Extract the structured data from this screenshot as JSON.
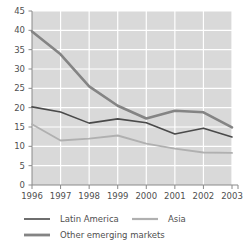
{
  "chart_data": {
    "type": "line",
    "title": "",
    "xlabel": "",
    "ylabel": "",
    "categories": [
      "1996",
      "1997",
      "1998",
      "1999",
      "2000",
      "2001",
      "2002",
      "2003"
    ],
    "x": [
      1996,
      1997,
      1998,
      1999,
      2000,
      2001,
      2002,
      2003
    ],
    "ylim": [
      0,
      45
    ],
    "xlim": [
      1996,
      2003
    ],
    "y_ticks": [
      0,
      5,
      10,
      15,
      20,
      25,
      30,
      35,
      40,
      45
    ],
    "y_tick_labels": [
      "0",
      "5",
      "10",
      "15",
      "20",
      "25",
      "30",
      "35",
      "40",
      "45"
    ],
    "grid": true,
    "grid_color": "#ffffff",
    "plot_background": "#d9d9d9",
    "legend_position": "bottom",
    "series": [
      {
        "name": "Latin America",
        "color": "#4a4a4a",
        "width": 1.6,
        "values": [
          20.2,
          18.9,
          16.0,
          17.1,
          16.1,
          13.2,
          14.7,
          12.4
        ]
      },
      {
        "name": "Asia",
        "color": "#b0b0b0",
        "width": 1.9,
        "values": [
          15.7,
          11.5,
          12.0,
          12.8,
          10.7,
          9.4,
          8.4,
          8.3
        ]
      },
      {
        "name": "Other emerging markets",
        "color": "#848484",
        "width": 2.6,
        "values": [
          39.7,
          33.8,
          25.5,
          20.5,
          17.2,
          19.2,
          18.8,
          14.9
        ]
      }
    ]
  },
  "axes": {
    "y_labels": [
      "45",
      "40",
      "35",
      "30",
      "25",
      "20",
      "15",
      "10",
      "5",
      "0"
    ],
    "x_labels": [
      "1996",
      "1997",
      "1998",
      "1999",
      "2000",
      "2001",
      "2002",
      "2003"
    ]
  },
  "legend": {
    "entries": [
      {
        "label": "Latin America",
        "color": "#4a4a4a",
        "width": 1.6
      },
      {
        "label": "Asia",
        "color": "#b0b0b0",
        "width": 2.2
      },
      {
        "label": "Other emerging markets",
        "color": "#848484",
        "width": 2.8
      }
    ]
  },
  "colors": {
    "plot_bg": "#d9d9d9",
    "grid": "#ffffff",
    "axis": "#8a8a8a",
    "text": "#4f4f4f",
    "latin_america": "#4a4a4a",
    "asia": "#b0b0b0",
    "other_emerging": "#848484"
  }
}
